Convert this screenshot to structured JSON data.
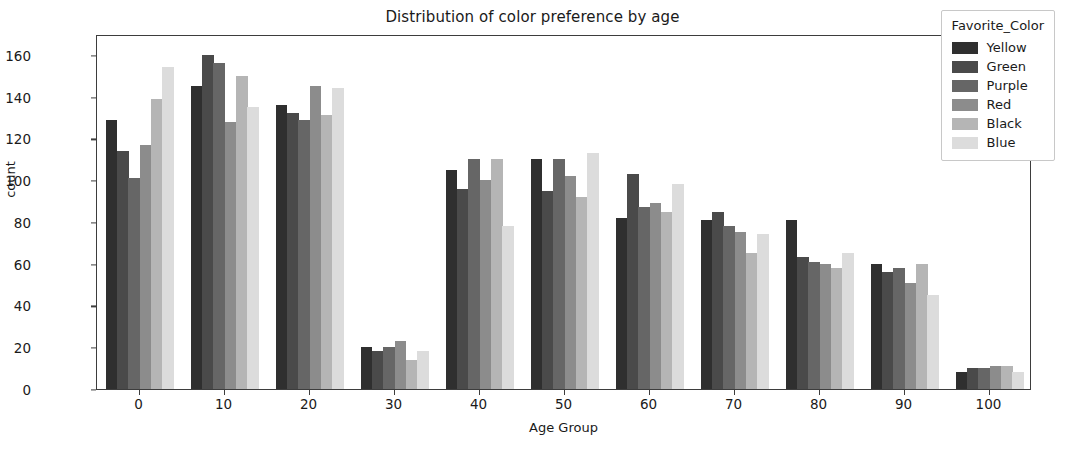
{
  "chart_data": {
    "type": "bar",
    "title": "Distribution of color preference by age",
    "xlabel": "Age Group",
    "ylabel": "count",
    "categories": [
      "0",
      "10",
      "20",
      "30",
      "40",
      "50",
      "60",
      "70",
      "80",
      "90",
      "100"
    ],
    "series": [
      {
        "name": "Yellow",
        "color": "#2f2f2f",
        "values": [
          129,
          145,
          136,
          20,
          105,
          110,
          82,
          81,
          81,
          60,
          8
        ]
      },
      {
        "name": "Green",
        "color": "#4a4a4a",
        "values": [
          114,
          160,
          132,
          18,
          96,
          95,
          103,
          85,
          63,
          56,
          10
        ]
      },
      {
        "name": "Purple",
        "color": "#666666",
        "values": [
          101,
          156,
          129,
          20,
          110,
          110,
          87,
          78,
          61,
          58,
          10
        ]
      },
      {
        "name": "Red",
        "color": "#8c8c8c",
        "values": [
          117,
          128,
          145,
          23,
          100,
          102,
          89,
          75,
          60,
          51,
          11
        ]
      },
      {
        "name": "Black",
        "color": "#b5b5b5",
        "values": [
          139,
          150,
          131,
          14,
          110,
          92,
          85,
          65,
          58,
          60,
          11
        ]
      },
      {
        "name": "Blue",
        "color": "#dcdcdc",
        "values": [
          154,
          135,
          144,
          18,
          78,
          113,
          98,
          74,
          65,
          45,
          8
        ]
      }
    ],
    "ylim": [
      0,
      170
    ],
    "yticks": [
      0,
      20,
      40,
      60,
      80,
      100,
      120,
      140,
      160
    ],
    "grid": false,
    "legend": {
      "title": "Favorite_Color",
      "position": "upper right",
      "entries": [
        "Yellow",
        "Green",
        "Purple",
        "Red",
        "Black",
        "Blue"
      ]
    }
  }
}
